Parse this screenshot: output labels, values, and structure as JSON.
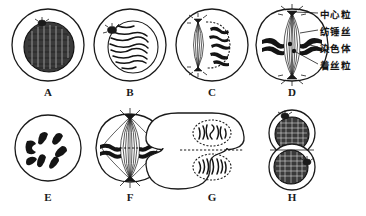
{
  "figure": {
    "background_color": "#ffffff",
    "ink_color": "#1a1a1a",
    "panel_count": 8
  },
  "annotations": {
    "items": [
      {
        "id": "centriole",
        "label": "中心粒",
        "target_panel": "D",
        "target": "spindle-pole"
      },
      {
        "id": "spindle",
        "label": "纺锤丝",
        "target_panel": "D",
        "target": "spindle-fiber"
      },
      {
        "id": "chromosome",
        "label": "染色体",
        "target_panel": "D",
        "target": "chromosome"
      },
      {
        "id": "centromere",
        "label": "着丝粒",
        "target_panel": "D",
        "target": "centromere"
      }
    ]
  },
  "panels": [
    {
      "letter": "A",
      "stage": "interphase",
      "desc": "完整细胞核，染色质密集，核旁有中心粒"
    },
    {
      "letter": "B",
      "stage": "early-prophase",
      "desc": "染色质丝开始螺旋化变粗"
    },
    {
      "letter": "C",
      "stage": "late-prophase",
      "desc": "核膜开始解体，纺锤体出现"
    },
    {
      "letter": "D",
      "stage": "metaphase",
      "desc": "染色体着丝粒排列在赤道板上"
    },
    {
      "letter": "E",
      "stage": "chromosomes",
      "desc": "游离的染色体散布于细胞中"
    },
    {
      "letter": "F",
      "stage": "anaphase-spindle",
      "desc": "纺锤体形成，染色单体移向两极"
    },
    {
      "letter": "G",
      "stage": "telophase",
      "desc": "细胞板形成，两个子核重建"
    },
    {
      "letter": "H",
      "stage": "daughter-cells",
      "desc": "形成两个子细胞"
    }
  ]
}
